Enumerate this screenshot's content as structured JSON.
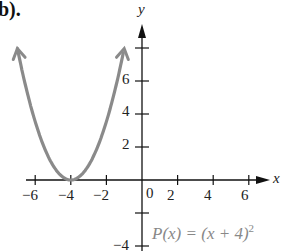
{
  "part_label": "b).",
  "chart_data": {
    "type": "line",
    "title": "",
    "function": "P(x) = (x + 4)^2",
    "equation_label": {
      "prefix": "P(x) = (x + 4)",
      "exponent": "2"
    },
    "xlabel": "x",
    "ylabel": "y",
    "x_ticks": [
      -6,
      -4,
      -2,
      2,
      4,
      6
    ],
    "x_tick_labels": [
      "−6",
      "−4",
      "−2",
      "2",
      "4",
      "6"
    ],
    "y_ticks": [
      -4,
      -2,
      2,
      4,
      6,
      8
    ],
    "y_tick_labels": [
      "−4",
      "2",
      "4",
      "6"
    ],
    "origin_label": "0",
    "xlim": [
      -6.5,
      7.5
    ],
    "ylim": [
      -4,
      9.5
    ],
    "grid": false,
    "legend": null,
    "series": [
      {
        "name": "P(x) = (x + 4)^2",
        "color": "#8a8a8a",
        "x": [
          -7,
          -6.5,
          -6,
          -5.5,
          -5,
          -4.5,
          -4,
          -3.5,
          -3,
          -2.5,
          -2,
          -1.5,
          -1
        ],
        "y": [
          9,
          6.25,
          4,
          2.25,
          1,
          0.25,
          0,
          0.25,
          1,
          2.25,
          4,
          6.25,
          9
        ],
        "vertex": [
          -4,
          0
        ],
        "arrows_both_ends": true
      }
    ]
  }
}
